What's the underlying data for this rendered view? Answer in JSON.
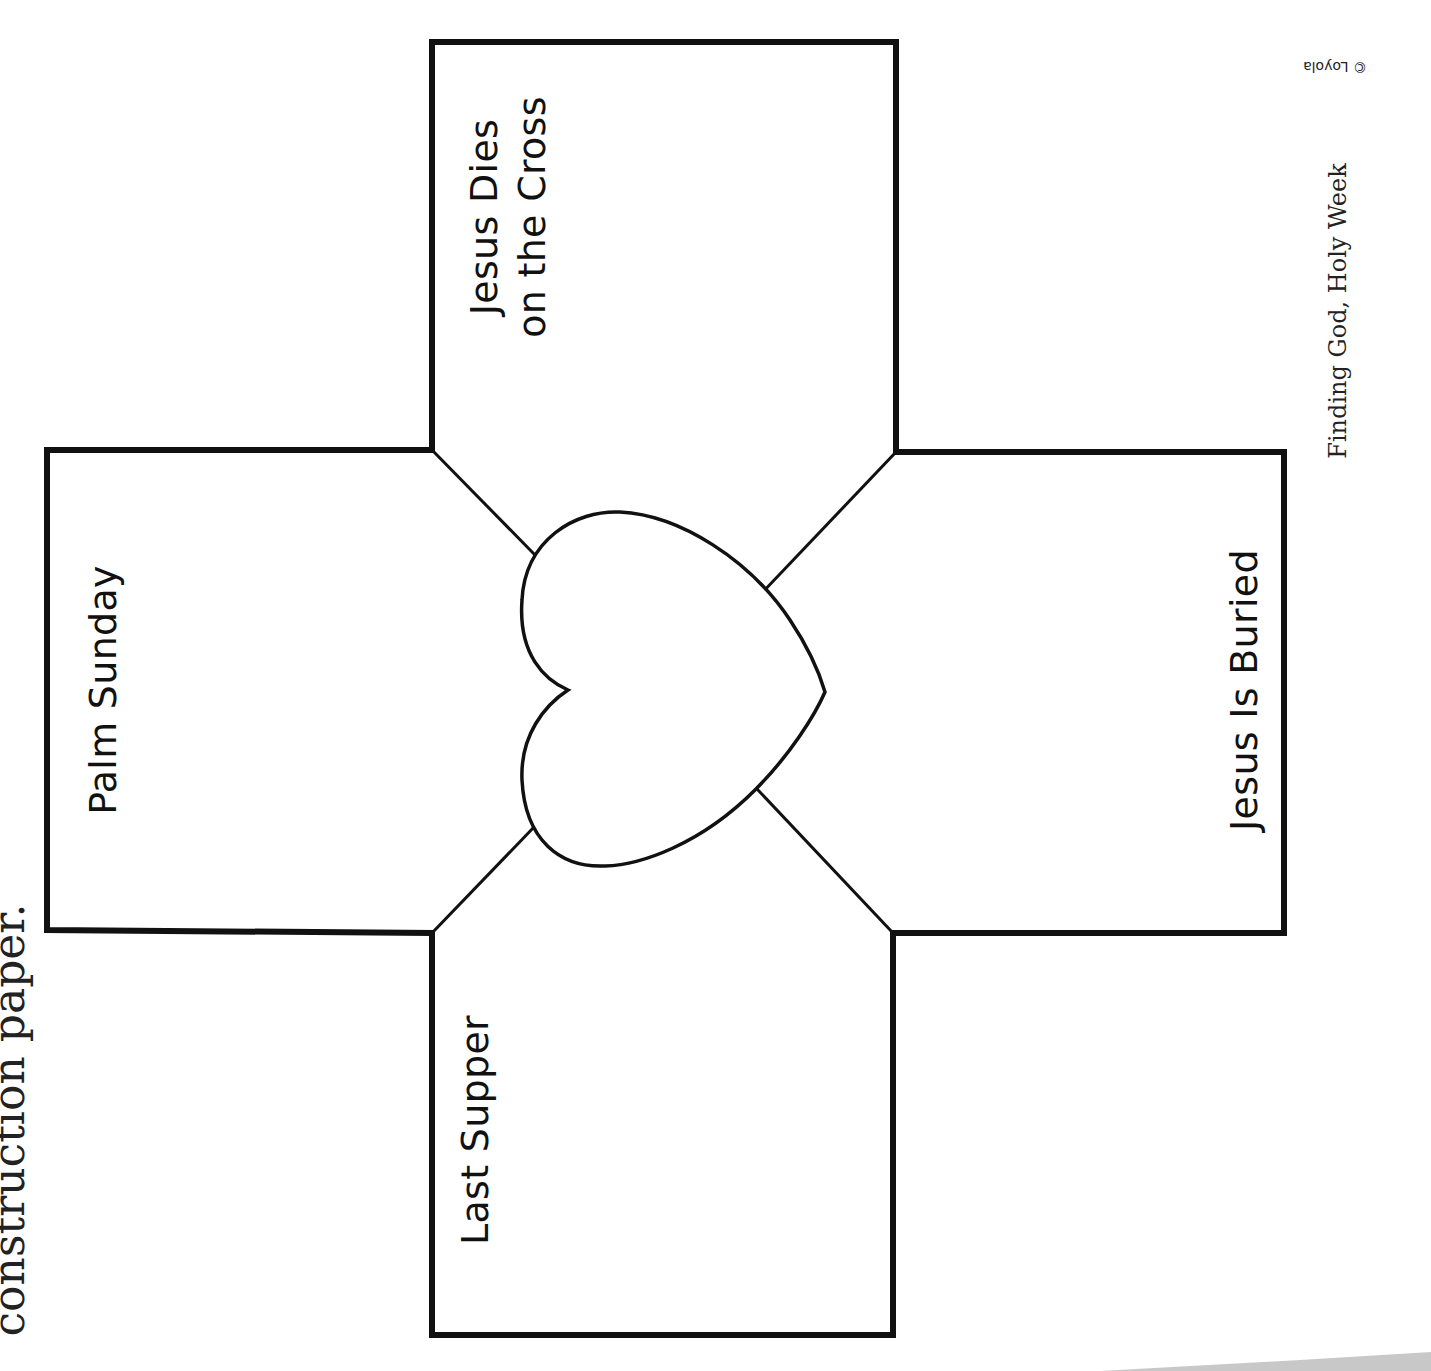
{
  "instruction_fragment": "construction paper.",
  "cross": {
    "panels": [
      {
        "id": "top",
        "lines": [
          "Jesus Dies",
          "on the Cross"
        ]
      },
      {
        "id": "left",
        "lines": [
          "Palm Sunday"
        ]
      },
      {
        "id": "right",
        "lines": [
          "Jesus Is Buried"
        ]
      },
      {
        "id": "bottom",
        "lines": [
          "Last Supper"
        ]
      }
    ],
    "center_icon": "heart-outline"
  },
  "footer": {
    "title": "Finding God, Holy Week",
    "copyright": "© Loyola"
  },
  "colors": {
    "ink": "#111111",
    "paper": "#ffffff",
    "page_shadow": "#c8c8c8"
  }
}
